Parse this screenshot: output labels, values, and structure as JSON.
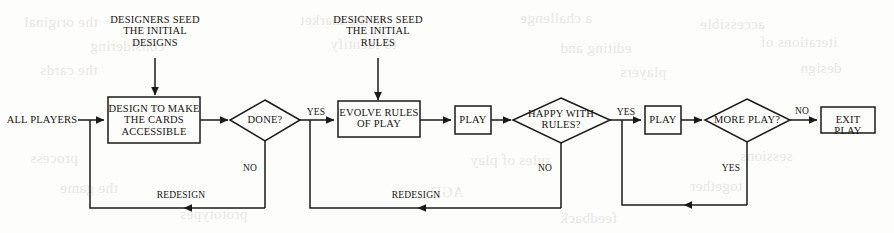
{
  "diagram": {
    "background_color": "#fdfdfc",
    "line_color": "#1a1a1a",
    "text_color": "#15130f",
    "captions": [
      {
        "id": "seed-designs",
        "text": "DESIGNERS SEED\nTHE INITIAL\nDESIGNS"
      },
      {
        "id": "seed-rules",
        "text": "DESIGNERS SEED\nTHE INITIAL\nRULES"
      }
    ],
    "terminals": [
      {
        "id": "all-players",
        "text": "ALL PLAYERS"
      }
    ],
    "nodes": [
      {
        "id": "design-cards",
        "shape": "rect",
        "text": "DESIGN TO MAKE\nTHE CARDS\nACCESSIBLE"
      },
      {
        "id": "done",
        "shape": "diamond",
        "text": "DONE?"
      },
      {
        "id": "evolve-rules",
        "shape": "rect",
        "text": "EVOLVE RULES\nOF PLAY"
      },
      {
        "id": "play-1",
        "shape": "rect",
        "text": "PLAY"
      },
      {
        "id": "happy-with-rules",
        "shape": "diamond",
        "text": "HAPPY WITH\nRULES?"
      },
      {
        "id": "play-2",
        "shape": "rect",
        "text": "PLAY"
      },
      {
        "id": "more-play",
        "shape": "diamond",
        "text": "MORE PLAY?"
      },
      {
        "id": "exit-play",
        "shape": "rect",
        "text": "EXIT PLAY"
      }
    ],
    "edge_labels": [
      {
        "id": "done-yes",
        "text": "YES"
      },
      {
        "id": "done-no",
        "text": "NO"
      },
      {
        "id": "redesign-1",
        "text": "REDESIGN"
      },
      {
        "id": "happy-yes",
        "text": "YES"
      },
      {
        "id": "happy-no",
        "text": "NO"
      },
      {
        "id": "redesign-2",
        "text": "REDESIGN"
      },
      {
        "id": "more-play-no",
        "text": "NO"
      },
      {
        "id": "more-play-yes",
        "text": "YES"
      }
    ],
    "ghost_text": [
      {
        "text": "the original",
        "x": 24,
        "y": 14
      },
      {
        "text": "in the market",
        "x": 300,
        "y": 12
      },
      {
        "text": "a challenge",
        "x": 520,
        "y": 10
      },
      {
        "text": "accessible",
        "x": 700,
        "y": 16
      },
      {
        "text": "considering",
        "x": 90,
        "y": 38
      },
      {
        "text": "to identify",
        "x": 330,
        "y": 36
      },
      {
        "text": "editing and",
        "x": 560,
        "y": 40
      },
      {
        "text": "iterations of",
        "x": 760,
        "y": 34
      },
      {
        "text": "the cards",
        "x": 40,
        "y": 62
      },
      {
        "text": "players",
        "x": 620,
        "y": 64
      },
      {
        "text": "design",
        "x": 800,
        "y": 60
      },
      {
        "text": "process",
        "x": 30,
        "y": 150
      },
      {
        "text": "rules of play",
        "x": 470,
        "y": 152
      },
      {
        "text": "sessions",
        "x": 740,
        "y": 148
      },
      {
        "text": "the game",
        "x": 60,
        "y": 180
      },
      {
        "text": "AGD",
        "x": 430,
        "y": 184
      },
      {
        "text": "together",
        "x": 690,
        "y": 178
      },
      {
        "text": "prototypes",
        "x": 180,
        "y": 206
      },
      {
        "text": "feedback",
        "x": 560,
        "y": 210
      }
    ]
  }
}
